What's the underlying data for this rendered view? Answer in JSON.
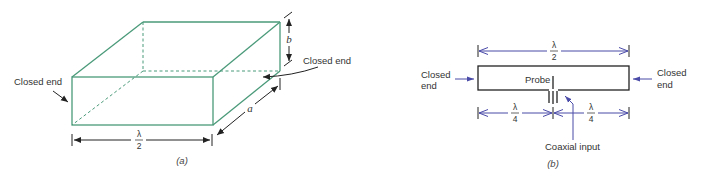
{
  "figure_a": {
    "caption": "(a)",
    "left_label": "Closed end",
    "right_label": "Closed end",
    "dim_length": {
      "num": "λ",
      "den": "2"
    },
    "dim_a": "a",
    "dim_b": "b",
    "box_color": "#4a9a7a",
    "line_color": "#222222"
  },
  "figure_b": {
    "caption": "(b)",
    "left_label": [
      "Closed",
      "end"
    ],
    "right_label": [
      "Closed",
      "end"
    ],
    "probe_label": "Probe",
    "input_label": "Coaxial input",
    "dim_total": {
      "num": "λ",
      "den": "2"
    },
    "dim_left": {
      "num": "λ",
      "den": "4"
    },
    "dim_right": {
      "num": "λ",
      "den": "4"
    },
    "dim_color": "#4a4aa8",
    "outline_color": "#222222"
  }
}
